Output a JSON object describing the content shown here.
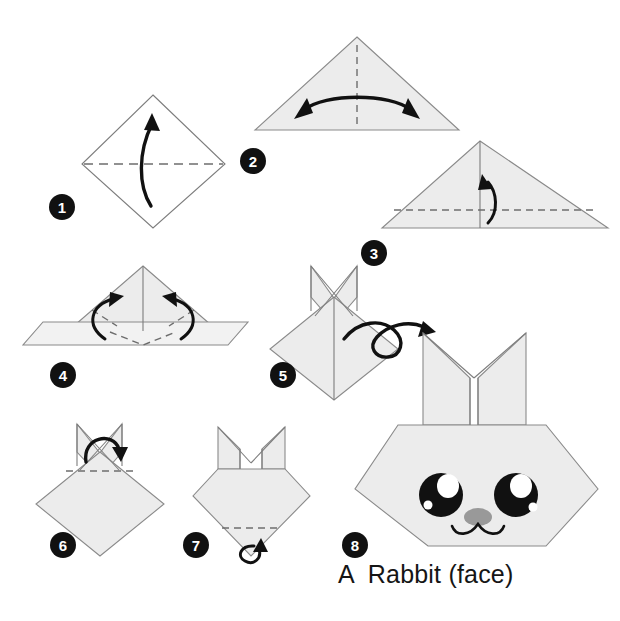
{
  "document": {
    "title": "A  Rabbit (face)",
    "caption": "A  Rabbit (face)",
    "background_color": "#ffffff",
    "paper_color": "#ececec",
    "line_color": "#7d7d7d",
    "ink_color": "#111111"
  },
  "steps": [
    {
      "number": "1",
      "badge_label": "1",
      "shape": "square-diamond",
      "paper_side": "white",
      "creases": [
        "horizontal valley fold across the middle"
      ],
      "arrows": [
        "single curved arrow pointing up"
      ],
      "description": "Fold the square in half upward along the horizontal diagonal."
    },
    {
      "number": "2",
      "badge_label": "2",
      "shape": "triangle-apex-up",
      "paper_side": "shaded",
      "creases": [
        "vertical dashed center line"
      ],
      "arrows": [
        "double-headed curved arrow"
      ],
      "description": "Fold in half left to right and unfold to mark the vertical center crease."
    },
    {
      "number": "3",
      "badge_label": "3",
      "shape": "triangle-apex-up",
      "paper_side": "shaded",
      "creases": [
        "solid vertical center line",
        "horizontal dashed line near the base"
      ],
      "arrows": [
        "small curved arrow pointing up"
      ],
      "description": "Fold the bottom edge up along the dashed line."
    },
    {
      "number": "4",
      "badge_label": "4",
      "shape": "triangle-with-folded-band",
      "paper_side": "shaded",
      "creases": [
        "two dashed diagonal creases forming a V"
      ],
      "arrows": [
        "two curved arrows folding inward and up"
      ],
      "description": "Fold both lower corners up along the dashed creases."
    },
    {
      "number": "5",
      "badge_label": "5",
      "shape": "diamond-with-crossed-ears",
      "paper_side": "shaded",
      "creases": [],
      "arrows": [
        "loop arrow: turn the model over"
      ],
      "description": "Turn the model over."
    },
    {
      "number": "6",
      "badge_label": "6",
      "shape": "diamond-with-crossed-ears",
      "paper_side": "shaded",
      "creases": [
        "horizontal dashed line below the ears"
      ],
      "arrows": [
        "curved arrow folding the top point down"
      ],
      "description": "Fold the top point down along the dashed line."
    },
    {
      "number": "7",
      "badge_label": "7",
      "shape": "head-with-upright-ears",
      "paper_side": "shaded",
      "creases": [
        "horizontal dashed line near the bottom point"
      ],
      "arrows": [
        "small curl arrow folding the bottom tip behind"
      ],
      "description": "Fold the bottom point behind along the dashed line."
    },
    {
      "number": "8",
      "badge_label": "8",
      "shape": "finished-rabbit-face",
      "paper_side": "shaded",
      "creases": [],
      "arrows": [],
      "description": "Finished rabbit face with eyes, nose and mouth drawn on.",
      "face": {
        "eyes": 2,
        "eye_color": "#111111",
        "eye_highlight_color": "#ffffff",
        "nose_color": "#999999",
        "mouth": "w-shaped curve"
      }
    }
  ]
}
